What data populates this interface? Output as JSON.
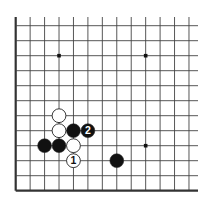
{
  "diagram": {
    "type": "go-board-fragment",
    "background": "#ffffff",
    "line_color": "#444444",
    "edge_color": "#333333",
    "visible_columns": 13,
    "visible_rows": 12,
    "edges": [
      "left",
      "bottom"
    ],
    "grid": {
      "x0": 15.7,
      "dx": 14.44,
      "y0": 25.7,
      "dy": 15.0,
      "line_top": 17,
      "line_right": 198
    },
    "star_points": [
      {
        "col": 3,
        "row": 2
      },
      {
        "col": 9,
        "row": 2
      },
      {
        "col": 9,
        "row": 8
      }
    ],
    "stones": [
      {
        "col": 3,
        "row": 6,
        "color": "white",
        "label": ""
      },
      {
        "col": 3,
        "row": 7,
        "color": "white",
        "label": ""
      },
      {
        "col": 4,
        "row": 7,
        "color": "black",
        "label": ""
      },
      {
        "col": 5,
        "row": 7,
        "color": "black",
        "label": "2"
      },
      {
        "col": 2,
        "row": 8,
        "color": "black",
        "label": ""
      },
      {
        "col": 3,
        "row": 8,
        "color": "black",
        "label": ""
      },
      {
        "col": 4,
        "row": 8,
        "color": "white",
        "label": ""
      },
      {
        "col": 4,
        "row": 9,
        "color": "white",
        "label": "1"
      },
      {
        "col": 7,
        "row": 9,
        "color": "black",
        "label": ""
      }
    ],
    "move_labels": [
      "1",
      "2"
    ]
  }
}
